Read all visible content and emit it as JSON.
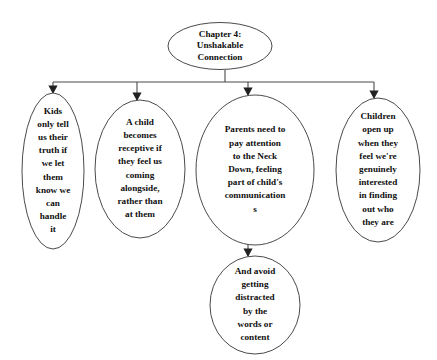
{
  "document": {
    "type": "flowchart",
    "background_color": "#ffffff",
    "line_color": "#4a4a4a",
    "text_color": "#100f0f",
    "shape": "ellipse"
  },
  "nodes": {
    "root": {
      "id": "chapter-title",
      "lines": [
        "Chapter 4:",
        "Unshakable",
        "Connection"
      ],
      "cx": 220,
      "cy": 46,
      "rx": 52,
      "ry": 23.5,
      "line_height": 11.5
    },
    "branches": [
      {
        "id": "kids-truth",
        "lines": [
          "Kids",
          "only tell",
          "us their",
          "truth if",
          "we let",
          "them",
          "know we",
          "can",
          "handle",
          "it"
        ],
        "cx": 53,
        "cy": 171,
        "rx": 31,
        "ry": 78,
        "line_height": 13.2
      },
      {
        "id": "child-receptive",
        "lines": [
          "A child",
          "becomes",
          "receptive if",
          "they feel us",
          "coming",
          "alongside,",
          "rather than",
          "at them"
        ],
        "cx": 140,
        "cy": 169,
        "rx": 45,
        "ry": 69,
        "line_height": 13.2
      },
      {
        "id": "parents-neck-down",
        "lines": [
          "Parents need to",
          "pay attention",
          "to the Neck",
          "Down, feeling",
          "part of child's",
          "communication",
          "s"
        ],
        "cx": 255,
        "cy": 170,
        "rx": 59,
        "ry": 75,
        "line_height": 13.2
      },
      {
        "id": "children-open-up",
        "lines": [
          "Children",
          "open up",
          "when they",
          "feel we're",
          "genuinely",
          "interested",
          "in finding",
          "out who",
          "they are"
        ],
        "cx": 378,
        "cy": 170,
        "rx": 42,
        "ry": 72,
        "line_height": 13.2
      }
    ],
    "leaf": {
      "id": "avoid-distraction",
      "lines": [
        "And avoid",
        "getting",
        "distracted",
        "by the",
        "words or",
        "content"
      ],
      "cx": 255,
      "cy": 305,
      "rx": 45,
      "ry": 49,
      "line_height": 13.2
    }
  },
  "connectors": {
    "root_stem": {
      "x": 225,
      "y1": 70,
      "y2": 82
    },
    "bus": {
      "y": 82,
      "x1": 53,
      "x2": 374
    },
    "drops": [
      {
        "x": 53,
        "y1": 82,
        "y2": 93
      },
      {
        "x": 137,
        "y1": 82,
        "y2": 100
      },
      {
        "x": 248,
        "y1": 82,
        "y2": 95
      },
      {
        "x": 374,
        "y1": 82,
        "y2": 98
      }
    ],
    "leaf_drop": {
      "x": 248,
      "y1": 243,
      "y2": 256
    }
  }
}
